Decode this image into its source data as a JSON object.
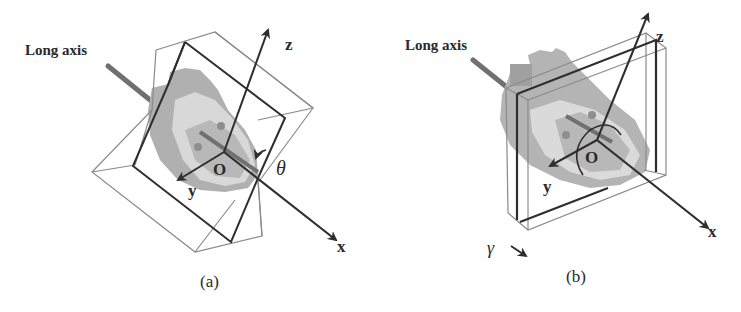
{
  "figure": {
    "panels": [
      {
        "id": "a",
        "caption": "(a)",
        "long_axis_label": "Long axis",
        "axes": {
          "x": "x",
          "y": "y",
          "z": "z"
        },
        "origin_label": "O",
        "angle_label": "θ",
        "slab_description": "thick rotated slab around x-axis"
      },
      {
        "id": "b",
        "caption": "(b)",
        "long_axis_label": "Long axis",
        "axes": {
          "x": "x",
          "y": "y",
          "z": "z"
        },
        "origin_label": "O",
        "angle_label": "γ",
        "slab_description": "thin slab perpendicular to x-axis"
      }
    ],
    "colors": {
      "line_dark": "#2e2e2e",
      "line_light": "#8a8a8a",
      "long_axis": "#707070",
      "heart_dark": "#a8a8a8",
      "heart_mid": "#c4c4c4",
      "heart_light": "#dcdcdc",
      "heart_inner": "#9a9a9a"
    }
  }
}
